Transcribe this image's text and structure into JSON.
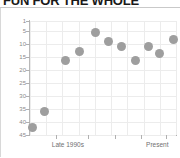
{
  "headline": {
    "text": "FUN FOR THE WHOLE"
  },
  "chart_data": {
    "type": "scatter",
    "title": "",
    "xlabel": "",
    "ylabel": "FIFA ranking",
    "ylim": [
      45,
      1
    ],
    "y_inverted": true,
    "grid": true,
    "legend": null,
    "y_ticks": [
      1,
      5,
      10,
      15,
      20,
      25,
      30,
      35,
      40,
      45
    ],
    "y_tick_labels": [
      "1",
      "5",
      "10",
      "15",
      "20",
      "25",
      "30",
      "35",
      "40",
      "45"
    ],
    "x_tick_labels": [
      "Late 1990s",
      "Present"
    ],
    "x_tick_positions": [
      0.18,
      0.93
    ],
    "marker_color": "#9e9e9e",
    "marker_size": 9,
    "points": [
      {
        "x": 0.02,
        "y": 42.0
      },
      {
        "x": 0.1,
        "y": 36.0
      },
      {
        "x": 0.24,
        "y": 16.2
      },
      {
        "x": 0.34,
        "y": 12.6
      },
      {
        "x": 0.45,
        "y": 5.5
      },
      {
        "x": 0.54,
        "y": 9.0
      },
      {
        "x": 0.63,
        "y": 10.9
      },
      {
        "x": 0.72,
        "y": 16.2
      },
      {
        "x": 0.81,
        "y": 10.8
      },
      {
        "x": 0.89,
        "y": 13.4
      },
      {
        "x": 0.98,
        "y": 8.2
      }
    ]
  },
  "colors": {
    "marker": "#9e9e9e",
    "grid": "#ececec",
    "axis": "#b0b0b0",
    "tick_text": "#8a8a8a",
    "axis_title": "#7d7d7d",
    "headline": "#1a1a1a"
  }
}
